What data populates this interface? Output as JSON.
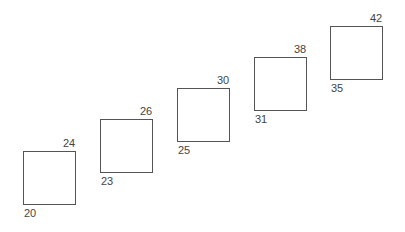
{
  "boxes": [
    {
      "x": 23,
      "y": 151,
      "bottom_left_label": "20",
      "top_right_label": "24"
    },
    {
      "x": 100,
      "y": 119,
      "bottom_left_label": "23",
      "top_right_label": "26"
    },
    {
      "x": 177,
      "y": 88,
      "bottom_left_label": "25",
      "top_right_label": "30"
    },
    {
      "x": 254,
      "y": 57,
      "bottom_left_label": "31",
      "top_right_label": "38"
    },
    {
      "x": 330,
      "y": 26,
      "bottom_left_label": "35",
      "top_right_label": "42"
    }
  ]
}
